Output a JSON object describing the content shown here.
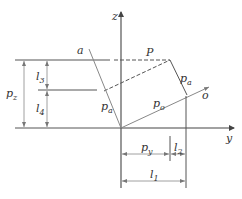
{
  "figure": {
    "axes": {
      "z": "z",
      "y": "y"
    },
    "points": {
      "P": "P"
    },
    "rays": {
      "a": "a",
      "o": "o"
    },
    "vectors": {
      "pa_left": {
        "base": "p",
        "sub": "a"
      },
      "pa_right": {
        "base": "p",
        "sub": "a"
      },
      "po": {
        "base": "p",
        "sub": "o"
      }
    },
    "dimensions": {
      "pz": {
        "base": "p",
        "sub": "z"
      },
      "l3": {
        "base": "l",
        "sub": "3"
      },
      "l4": {
        "base": "l",
        "sub": "4"
      },
      "py": {
        "base": "p",
        "sub": "y"
      },
      "l2": {
        "base": "l",
        "sub": "2"
      },
      "l1": {
        "base": "l",
        "sub": "1"
      }
    }
  },
  "colors": {
    "line": "#555555",
    "light": "#888888",
    "text": "#333333"
  }
}
